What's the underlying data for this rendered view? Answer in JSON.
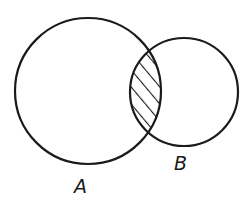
{
  "diagram": {
    "type": "venn",
    "sets": [
      {
        "label": "A",
        "cx": 88,
        "cy": 91,
        "r": 73
      },
      {
        "label": "B",
        "cx": 184,
        "cy": 92,
        "r": 54
      }
    ],
    "shaded_region": "A ∩ B",
    "stroke_color": "#1a1a1a",
    "background": "#ffffff"
  },
  "labels": {
    "a": "A",
    "b": "B"
  }
}
